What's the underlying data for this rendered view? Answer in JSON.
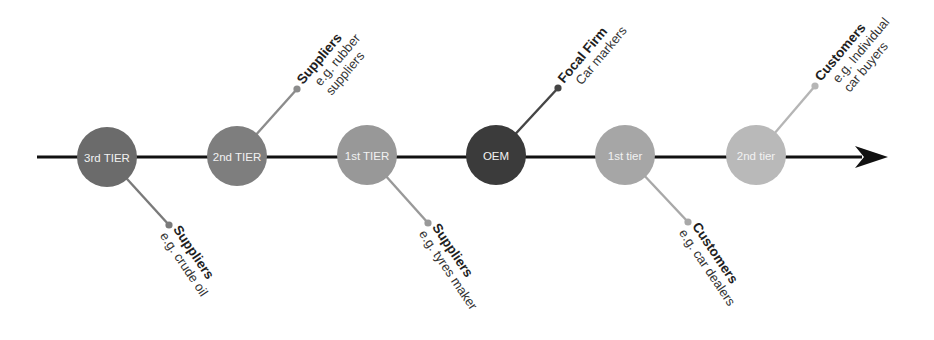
{
  "diagram": {
    "type": "supply-chain-timeline",
    "axis": {
      "x1": 37,
      "x2": 858,
      "y": 157,
      "color": "#111111",
      "arrow_tip_x": 888
    },
    "nodes": [
      {
        "id": "third-tier-supplier",
        "label": "3rd TIER",
        "cx": 107,
        "cy": 157,
        "r": 30,
        "fill": "#6b6b6b",
        "callout": {
          "direction": "down",
          "dot_x": 169,
          "dot_y": 225,
          "line_color": "#7a7a7a",
          "title": "Suppliers",
          "sub": [
            "e.g. crude oil"
          ]
        }
      },
      {
        "id": "second-tier-supplier",
        "label": "2nd TIER",
        "cx": 237,
        "cy": 156,
        "r": 30,
        "fill": "#7e7e7e",
        "callout": {
          "direction": "up",
          "dot_x": 297,
          "dot_y": 89,
          "line_color": "#8c8c8c",
          "title": "Suppliers",
          "sub": [
            "e.g. rubber",
            "suppliers"
          ]
        }
      },
      {
        "id": "first-tier-supplier",
        "label": "1st TIER",
        "cx": 367,
        "cy": 155,
        "r": 30,
        "fill": "#989898",
        "callout": {
          "direction": "down",
          "dot_x": 428,
          "dot_y": 223,
          "line_color": "#999999",
          "title": "Suppliers",
          "sub": [
            "e.g. tyres maker"
          ]
        }
      },
      {
        "id": "oem",
        "label": "OEM",
        "cx": 496,
        "cy": 155,
        "r": 30,
        "fill": "#3b3b3b",
        "callout": {
          "direction": "up",
          "dot_x": 558,
          "dot_y": 88,
          "line_color": "#454545",
          "title": "Focal Firm",
          "sub": [
            "Car markers"
          ]
        }
      },
      {
        "id": "first-tier-customer",
        "label": "1st tier",
        "cx": 625,
        "cy": 155,
        "r": 30,
        "fill": "#a6a6a6",
        "callout": {
          "direction": "down",
          "dot_x": 688,
          "dot_y": 222,
          "line_color": "#a8a8a8",
          "title": "Customers",
          "sub": [
            "e.g. car dealers"
          ]
        }
      },
      {
        "id": "second-tier-customer",
        "label": "2nd tier",
        "cx": 756,
        "cy": 155,
        "r": 30,
        "fill": "#b9b9b9",
        "callout": {
          "direction": "up",
          "dot_x": 815,
          "dot_y": 86,
          "line_color": "#b5b5b5",
          "title": "Customers",
          "sub": [
            "e.g. Individual",
            "car buyers"
          ]
        }
      }
    ]
  }
}
